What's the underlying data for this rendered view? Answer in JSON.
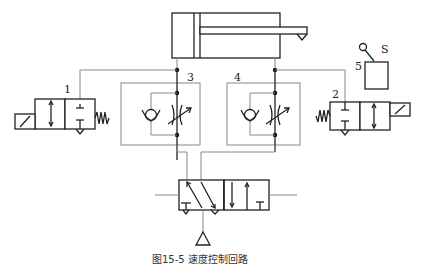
{
  "diagram": {
    "type": "pneumatic speed control circuit",
    "labels": {
      "valve_1": "1",
      "valve_2": "2",
      "flow_control_3": "3",
      "flow_control_4": "4",
      "limit_switch_5": "5",
      "switch_s": "S"
    },
    "components": [
      {
        "id": "cylinder",
        "name": "double-acting cylinder"
      },
      {
        "id": "1",
        "name": "solenoid 2/2 valve with spring return (left)"
      },
      {
        "id": "2",
        "name": "solenoid 2/2 valve with spring return (right)"
      },
      {
        "id": "3",
        "name": "one-way flow control valve (check + adjustable throttle)"
      },
      {
        "id": "4",
        "name": "one-way flow control valve (check + adjustable throttle)"
      },
      {
        "id": "5",
        "name": "limit switch box"
      },
      {
        "id": "S",
        "name": "switch lever"
      },
      {
        "id": "main-valve",
        "name": "directional control valve"
      },
      {
        "id": "supply",
        "name": "pressure source triangle"
      }
    ],
    "caption": "图15-5 速度控制回路"
  },
  "colors": {
    "line": "#888888",
    "symbol": "#222222",
    "background": "#ffffff"
  }
}
